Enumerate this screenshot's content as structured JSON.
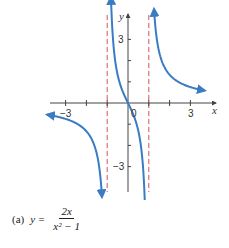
{
  "chart_data": {
    "type": "line",
    "title": "",
    "function": "y = 2x/(x^2 - 1)",
    "xlabel": "x",
    "ylabel": "y",
    "xlim": [
      -4,
      4
    ],
    "ylim": [
      -4.4,
      4.4
    ],
    "x_ticks": [
      -3,
      -2,
      -1,
      1,
      2,
      3
    ],
    "x_tick_labels": [
      {
        "value": -3,
        "text": "−3"
      },
      {
        "value": 3,
        "text": "3"
      }
    ],
    "y_ticks": [
      -3,
      -2,
      -1,
      1,
      2,
      3
    ],
    "y_tick_labels": [
      {
        "value": 3,
        "text": "3"
      },
      {
        "value": -3,
        "text": "−3"
      }
    ],
    "origin_label": "0",
    "vertical_asymptotes": [
      -1,
      1
    ],
    "series": [
      {
        "name": "left-branch",
        "x_range": [
          -3.9,
          -1.25
        ]
      },
      {
        "name": "middle-branch",
        "x_range": [
          -0.82,
          0.82
        ]
      },
      {
        "name": "right-branch",
        "x_range": [
          1.25,
          3.7
        ]
      }
    ],
    "colors": {
      "curve": "#3a7cc4",
      "asymptote": "#d94f5c",
      "axis": "#444444"
    },
    "grid": false
  },
  "caption": {
    "label": "(a)",
    "lhs": "y =",
    "numerator": "2x",
    "denominator": "x² − 1"
  }
}
